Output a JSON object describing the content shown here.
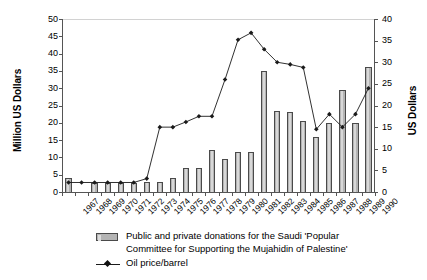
{
  "chart_data": {
    "type": "bar",
    "title": "",
    "subtitle": "",
    "xlabel": "",
    "ylabel": "Million US Dollars",
    "y2label": "US Dollars",
    "ylim": [
      0,
      50
    ],
    "y2lim": [
      0,
      40
    ],
    "yticks": [
      0,
      5,
      10,
      15,
      20,
      25,
      30,
      35,
      40,
      45,
      50
    ],
    "y2ticks": [
      0,
      5,
      10,
      15,
      20,
      25,
      30,
      35,
      40
    ],
    "grid": false,
    "legend_position": "bottom",
    "categories": [
      "1967",
      "1968",
      "1969",
      "1970",
      "1971",
      "1972",
      "1973",
      "1974",
      "1975",
      "1976",
      "1977",
      "1978",
      "1979",
      "1980",
      "1981",
      "1982",
      "1983",
      "1984",
      "1985",
      "1986",
      "1987",
      "1988",
      "1989",
      "1990"
    ],
    "series": [
      {
        "name": "Public and private donations for the Saudi 'Popular Committee for Supporting the Mujahidin of Palestine'",
        "type": "bar",
        "axis": "left",
        "unit": "Million US Dollars",
        "color": "#b4b4b4",
        "edge_color": "#4a4a4a",
        "values": [
          4.0,
          0.0,
          2.5,
          2.5,
          2.5,
          2.5,
          3.0,
          3.0,
          4.0,
          7.0,
          7.0,
          12.0,
          9.5,
          11.5,
          11.5,
          35.0,
          23.5,
          23.0,
          20.5,
          16.0,
          20.0,
          29.5,
          20.0,
          36.0
        ]
      },
      {
        "name": "Oil price/barrel",
        "type": "line",
        "axis": "right",
        "unit": "US Dollars",
        "color": "#1a1a1a",
        "marker": "diamond",
        "values": [
          2.2,
          2.2,
          2.2,
          2.2,
          2.2,
          2.2,
          3.1,
          15.0,
          15.0,
          16.2,
          17.5,
          17.5,
          26.0,
          35.2,
          36.8,
          33.0,
          30.0,
          29.5,
          28.8,
          14.5,
          18.0,
          15.0,
          18.0,
          24.0
        ]
      }
    ],
    "legend": [
      {
        "label_line1": "Public and private donations for the Saudi 'Popular",
        "label_line2": "Committee for Supporting the Mujahidin of Palestine'",
        "swatch": "bar"
      },
      {
        "label_line1": "Oil price/barrel",
        "label_line2": "",
        "swatch": "line-diamond"
      }
    ]
  },
  "colors": {
    "bar_fill": "#b4b4b4",
    "bar_edge": "#4a4a4a",
    "line": "#1a1a1a",
    "axis": "#555555",
    "background": "#ffffff"
  }
}
